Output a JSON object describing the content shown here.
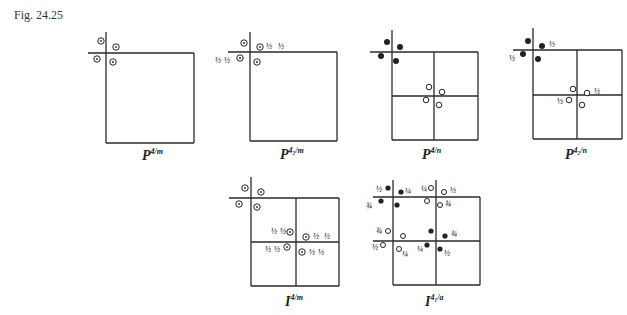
{
  "figure_label": "Fig. 24.25",
  "diagrams": [
    {
      "id": "p4m",
      "symbol": "P",
      "subscript": "4/m",
      "caption": "P4/m"
    },
    {
      "id": "p42m",
      "symbol": "P",
      "subscript": "4₂/m",
      "caption": "P4₂/m"
    },
    {
      "id": "p4n",
      "symbol": "P",
      "subscript": "4/n",
      "caption": "P4/n"
    },
    {
      "id": "p42n",
      "symbol": "P",
      "subscript": "4₂/n",
      "caption": "P4₂/n"
    },
    {
      "id": "i4m",
      "symbol": "I",
      "subscript": "4/m",
      "caption": "I4/m"
    },
    {
      "id": "i41a",
      "symbol": "I",
      "subscript": "4₁/a",
      "caption": "I4₁/a"
    }
  ],
  "fractions": {
    "half": "½",
    "quarter": "¼",
    "three_quarter": "¾"
  }
}
